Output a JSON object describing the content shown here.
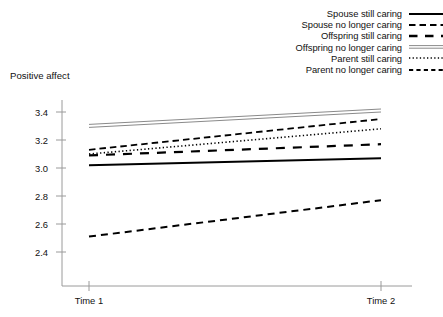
{
  "chart_data": {
    "type": "line",
    "title": "",
    "subtitle": "",
    "xlabel": "",
    "ylabel": "Positive affect",
    "x": [
      "Time 1",
      "Time 2"
    ],
    "categories": [
      "Time 1",
      "Time 2"
    ],
    "ylim": [
      2.3,
      3.5
    ],
    "yticks": [
      2.4,
      2.6,
      2.8,
      3.0,
      3.2,
      3.4
    ],
    "ytick_labels": [
      "2.4",
      "2.6",
      "2.8",
      "3.0",
      "3.2",
      "3.4"
    ],
    "grid": false,
    "legend_position": "top-right",
    "series": [
      {
        "name": "Spouse still caring",
        "style": "solid",
        "color": "#000000",
        "width": 2.0,
        "values": [
          3.02,
          3.07
        ]
      },
      {
        "name": "Spouse no longer caring",
        "style": "dashed",
        "color": "#000000",
        "width": 1.8,
        "values": [
          3.13,
          3.35
        ]
      },
      {
        "name": "Offspring still caring",
        "style": "long-dash",
        "color": "#000000",
        "width": 2.2,
        "values": [
          3.09,
          3.17
        ]
      },
      {
        "name": "Offspring no longer caring",
        "style": "double-thin",
        "color": "#8a8a8a",
        "width": 1.0,
        "values": [
          3.3,
          3.41
        ]
      },
      {
        "name": "Parent still caring",
        "style": "dotted",
        "color": "#000000",
        "width": 1.6,
        "values": [
          3.1,
          3.28
        ]
      },
      {
        "name": "Parent no longer caring",
        "style": "dash-gap",
        "color": "#000000",
        "width": 2.0,
        "values": [
          2.51,
          2.77
        ]
      }
    ]
  },
  "axes": {
    "y_title": "Positive affect",
    "y_tick_labels": [
      "3.4",
      "3.2",
      "3.0",
      "2.8",
      "2.6",
      "2.4"
    ],
    "x_tick_labels": [
      "Time 1",
      "Time 2"
    ]
  },
  "legend": {
    "items": [
      {
        "label": "Spouse still caring",
        "key": "solid-line-key"
      },
      {
        "label": "Spouse no longer caring",
        "key": "dashed-line-key"
      },
      {
        "label": "Offspring still caring",
        "key": "long-dash-line-key"
      },
      {
        "label": "Offspring no longer caring",
        "key": "double-thin-line-key"
      },
      {
        "label": "Parent still caring",
        "key": "dotted-line-key"
      },
      {
        "label": "Parent no longer caring",
        "key": "dash-gap-line-key"
      }
    ]
  },
  "colors": {
    "axis": "#9a9a9a",
    "text": "#111111",
    "line_dark": "#000000",
    "line_gray": "#8a8a8a",
    "background": "#ffffff"
  }
}
